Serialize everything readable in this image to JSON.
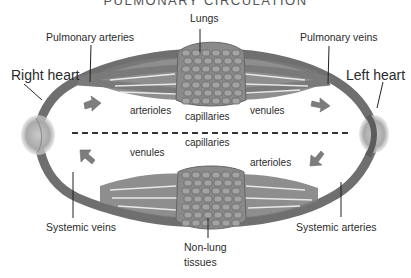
{
  "title": "PULMONARY CIRCULATION",
  "labels": {
    "lungs": "Lungs",
    "pulmonary_arteries": "Pulmonary arteries",
    "pulmonary_veins": "Pulmonary veins",
    "right_heart": "Right heart",
    "left_heart": "Left heart",
    "top_arterioles": "arterioles",
    "top_capillaries": "capillaries",
    "top_venules": "venules",
    "bottom_venules": "venules",
    "bottom_capillaries": "capillaries",
    "bottom_arterioles": "arterioles",
    "systemic_veins": "Systemic veins",
    "systemic_arteries": "Systemic arteries",
    "non_lung_tissues_1": "Non-lung",
    "non_lung_tissues_2": "tissues"
  },
  "colors": {
    "vessel": "#6f6f6f",
    "vessel_dark": "#555555",
    "tissue": "#8a8a8a",
    "heart": "#b5b5b5",
    "text": "#2b2b2b"
  },
  "flow_arrows": [
    {
      "name": "top-left",
      "direction": "right"
    },
    {
      "name": "top-right",
      "direction": "right"
    },
    {
      "name": "bottom-left",
      "direction": "up-left"
    },
    {
      "name": "bottom-right",
      "direction": "down-left"
    }
  ]
}
